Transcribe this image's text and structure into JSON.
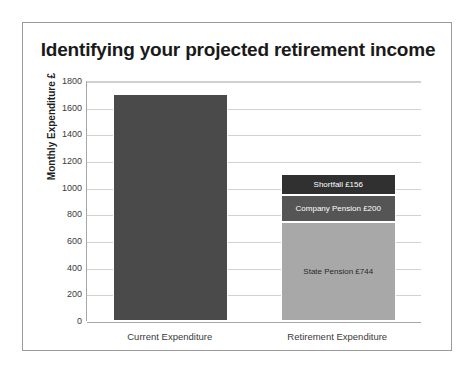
{
  "chart_data": {
    "type": "bar",
    "subtype": "stacked-bar",
    "title": "Identifying your projected retirement income",
    "xlabel": "",
    "ylabel": "Monthly Expenditure £",
    "ylim": [
      0,
      1800
    ],
    "ytick_step": 200,
    "yticks": [
      1800,
      1600,
      1400,
      1200,
      1000,
      800,
      600,
      400,
      200,
      0
    ],
    "grid": true,
    "legend": "none",
    "categories": [
      "Current Expenditure",
      "Retirement Expenditure"
    ],
    "series": [
      {
        "name": "Current Expenditure",
        "color": "#4a4a4a",
        "segments": [
          {
            "label": "",
            "value": 1700,
            "color": "#4a4a4a",
            "show_label": false
          }
        ],
        "total": 1700
      },
      {
        "name": "Retirement Expenditure",
        "total": 1100,
        "segments": [
          {
            "label": "State Pension £744",
            "value": 744,
            "color": "#a8a8a8",
            "show_label": true,
            "text_color": "dark"
          },
          {
            "label": "Company Pension £200",
            "value": 200,
            "color": "#555555",
            "show_label": true,
            "text_color": "light"
          },
          {
            "label": "Shortfall £156",
            "value": 156,
            "color": "#303030",
            "show_label": true,
            "text_color": "light"
          }
        ]
      }
    ],
    "annotations": [
      "Shortfall £156",
      "Company Pension £200",
      "State Pension £744"
    ]
  },
  "colors": {
    "frame": "#9a9a9a",
    "gridline": "#d2d2d2",
    "axis": "#a6a6a6",
    "title_text": "#1a1a1a",
    "tick_text": "#3a3a3a",
    "current_bar": "#4a4a4a",
    "shortfall": "#303030",
    "company_pension": "#555555",
    "state_pension": "#a8a8a8"
  }
}
